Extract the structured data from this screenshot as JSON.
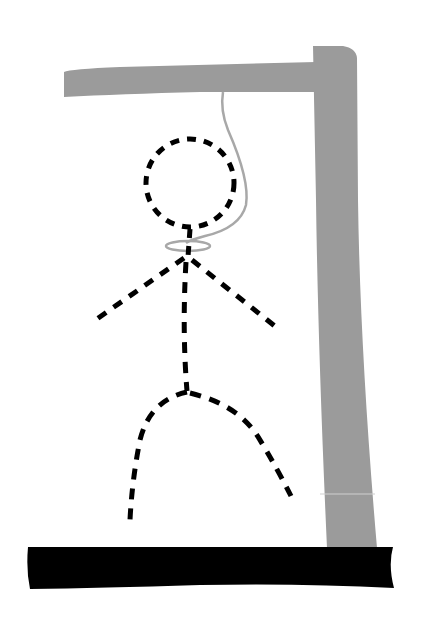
{
  "illustration": {
    "subject": "hangman",
    "colors": {
      "background": "#ffffff",
      "gallows": "#9b9b9b",
      "rope": "#a8a8a8",
      "figure": "#000000",
      "ground": "#000000"
    },
    "parts": [
      "gallows-beam",
      "gallows-post",
      "rope",
      "noose",
      "head",
      "body",
      "left-arm",
      "right-arm",
      "left-leg",
      "right-leg",
      "ground-base"
    ]
  }
}
